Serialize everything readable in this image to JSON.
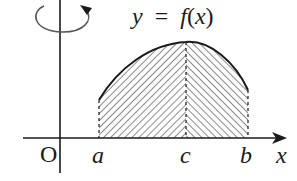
{
  "diagram": {
    "type": "solid-of-revolution-figure",
    "function_label": "y = f(x)",
    "function_label_parts": {
      "y": "y",
      "eq": "=",
      "f": "f",
      "lp": "(",
      "x": "x",
      "rp": ")"
    },
    "origin_label": "O",
    "x_axis_label": "x",
    "points": [
      {
        "name": "a",
        "label": "a"
      },
      {
        "name": "c",
        "label": "c"
      },
      {
        "name": "b",
        "label": "b"
      }
    ],
    "rotation_indicator": "rotation about y-axis",
    "region": "area under y = f(x) between x = a and x = b, hatched; dashed vertical lines at a, c, b",
    "colors": {
      "stroke": "#1a1a1a",
      "hatch": "#2a2a2a",
      "background": "#ffffff"
    }
  }
}
